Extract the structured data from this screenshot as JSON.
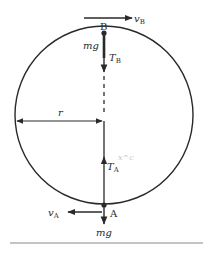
{
  "diagram": {
    "colors": {
      "ink": "#2a2a2a",
      "faint": "#c8c8c8",
      "background": "#ffffff"
    },
    "circle": {
      "cx": 104,
      "cy": 115,
      "r": 89
    },
    "points": {
      "B": {
        "label": "B",
        "position": "top"
      },
      "A": {
        "label": "A",
        "position": "bottom"
      }
    },
    "labels": {
      "vB_main": "v",
      "vB_sub": "B",
      "mg_top": "mg",
      "TB_main": "T",
      "TB_sub": "B",
      "radius": "r",
      "TA_main": "T",
      "TA_sub": "A",
      "vA_main": "v",
      "vA_sub": "A",
      "mg_bottom": "mg",
      "scribble": "x^c"
    }
  }
}
